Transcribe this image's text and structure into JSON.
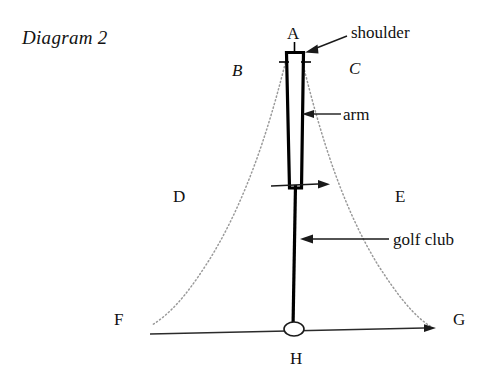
{
  "diagram": {
    "title": "Diagram 2",
    "point_labels": [
      {
        "name": "A",
        "text": "A",
        "x": 287,
        "y": 25
      },
      {
        "name": "F",
        "text": "F",
        "x": 114,
        "y": 311
      },
      {
        "name": "G",
        "text": "G",
        "x": 453,
        "y": 311
      },
      {
        "name": "H",
        "text": "H",
        "x": 290,
        "y": 350
      }
    ],
    "region_labels": [
      {
        "name": "B",
        "text": "B",
        "x": 232,
        "y": 62,
        "style": "italic"
      },
      {
        "name": "C",
        "text": "C",
        "x": 349,
        "y": 60,
        "style": "italic"
      },
      {
        "name": "D",
        "text": "D",
        "x": 173,
        "y": 188,
        "style": "upright"
      },
      {
        "name": "E",
        "text": "E",
        "x": 395,
        "y": 188,
        "style": "upright"
      }
    ],
    "callouts": [
      {
        "name": "shoulder",
        "text": "shoulder",
        "x": 351,
        "y": 24
      },
      {
        "name": "arm",
        "text": "arm",
        "x": 343,
        "y": 106
      },
      {
        "name": "golf-club",
        "text": "golf club",
        "x": 393,
        "y": 231
      }
    ],
    "colors": {
      "ink": "#111111",
      "line": "#000000",
      "dotted_arc": "#9a9a9a",
      "ground": "#2b2b2b"
    }
  }
}
